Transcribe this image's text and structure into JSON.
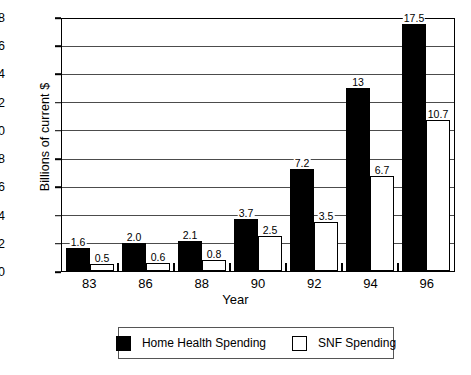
{
  "chart_data": {
    "type": "bar",
    "title": "",
    "xlabel": "Year",
    "ylabel": "Billions of current $",
    "categories": [
      "83",
      "86",
      "88",
      "90",
      "92",
      "94",
      "96"
    ],
    "ylim": [
      0,
      18
    ],
    "yticks": [
      0,
      2,
      4,
      6,
      8,
      10,
      12,
      14,
      16,
      18
    ],
    "ytick_labels": [
      "0",
      "2",
      "4",
      "6",
      "8",
      "10",
      "12",
      "14",
      "16",
      "18"
    ],
    "grid": true,
    "legend_position": "bottom",
    "series": [
      {
        "name": "Home Health Spending",
        "color": "#000000",
        "fill": "solid",
        "values": [
          1.6,
          2.0,
          2.1,
          3.7,
          7.2,
          13,
          17.5
        ],
        "labels": [
          "1.6",
          "2.0",
          "2.1",
          "3.7",
          "7.2",
          "13",
          "17.5"
        ]
      },
      {
        "name": "SNF Spending",
        "color": "#ffffff",
        "fill": "hollow",
        "values": [
          0.5,
          0.6,
          0.8,
          2.5,
          3.5,
          6.7,
          10.7
        ],
        "labels": [
          "0.5",
          "0.6",
          "0.8",
          "2.5",
          "3.5",
          "6.7",
          "10.7"
        ]
      }
    ]
  },
  "legend": {
    "items": [
      {
        "label": "Home Health Spending",
        "style": "dark"
      },
      {
        "label": "SNF Spending",
        "style": "light"
      }
    ]
  }
}
